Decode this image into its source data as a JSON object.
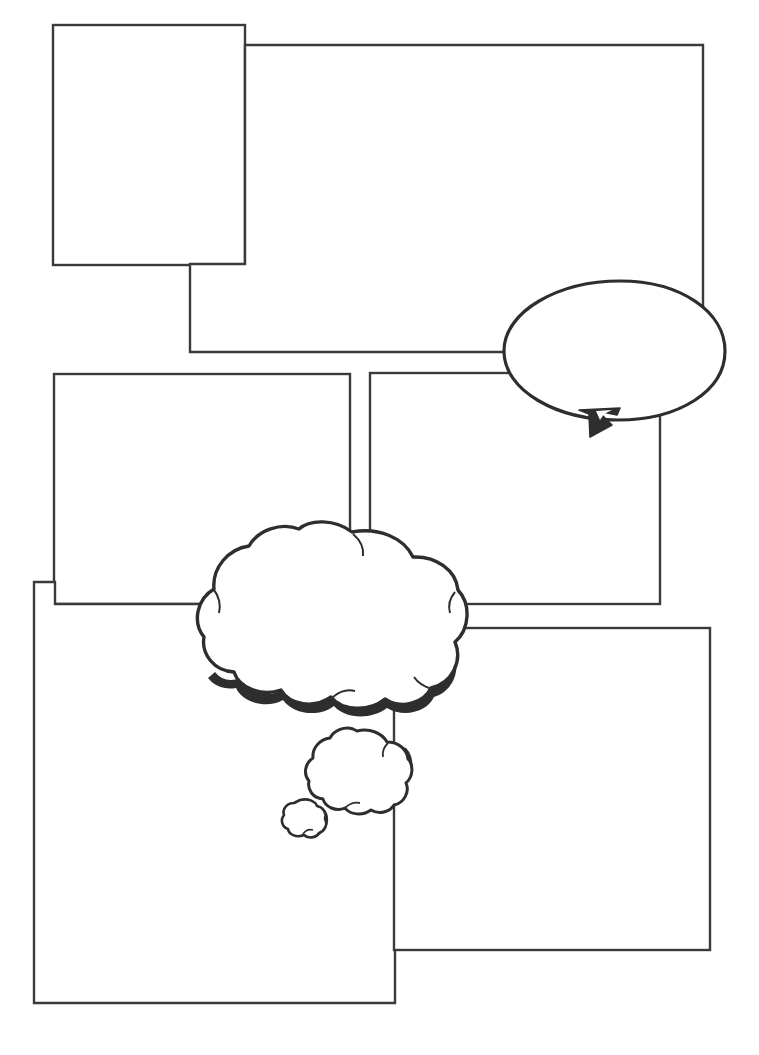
{
  "document": {
    "kind": "comic-strip-template",
    "title": "",
    "page_width": 759,
    "page_height": 1055,
    "background_color": "#ffffff",
    "ink_color": "#3a3a3a"
  },
  "panels": [
    {
      "id": "panel-1",
      "name": "top-left-panel",
      "label": "",
      "shape": "rectangle",
      "x": 53,
      "y": 25,
      "width": 192,
      "height": 240,
      "stroke_color": "#3a3a3a",
      "stroke_width": 2.4,
      "fill_color": "#ffffff"
    },
    {
      "id": "panel-2",
      "name": "top-right-panel",
      "label": "",
      "shape": "notched-rectangle",
      "x": 190,
      "y": 45,
      "width": 513,
      "height": 307,
      "stroke_color": "#3a3a3a",
      "stroke_width": 2.4,
      "fill_color": "#ffffff"
    },
    {
      "id": "panel-3",
      "name": "middle-left-panel",
      "label": "",
      "shape": "rectangle",
      "x": 54,
      "y": 374,
      "width": 296,
      "height": 230,
      "stroke_color": "#3a3a3a",
      "stroke_width": 2.4,
      "fill_color": "#ffffff"
    },
    {
      "id": "panel-4",
      "name": "middle-right-panel",
      "label": "",
      "shape": "rectangle",
      "x": 370,
      "y": 373,
      "width": 290,
      "height": 231,
      "stroke_color": "#3a3a3a",
      "stroke_width": 2.4,
      "fill_color": "#ffffff"
    },
    {
      "id": "panel-5",
      "name": "bottom-left-panel",
      "label": "",
      "shape": "notched-rectangle",
      "x": 34,
      "y": 582,
      "width": 361,
      "height": 421,
      "stroke_color": "#3a3a3a",
      "stroke_width": 2.4,
      "fill_color": "#ffffff"
    },
    {
      "id": "panel-6",
      "name": "bottom-right-panel",
      "label": "",
      "shape": "rectangle",
      "x": 394,
      "y": 628,
      "width": 316,
      "height": 322,
      "stroke_color": "#3a3a3a",
      "stroke_width": 2.4,
      "fill_color": "#ffffff"
    }
  ],
  "balloons": [
    {
      "id": "balloon-1",
      "name": "speech-balloon",
      "type": "speech",
      "text": "",
      "center_x": 614,
      "center_y": 350,
      "radius_x": 111,
      "radius_y": 70,
      "tail_direction": "down-left",
      "stroke_color": "#2e2e2e",
      "fill_color": "#ffffff"
    },
    {
      "id": "balloon-2",
      "name": "thought-cloud-large",
      "type": "thought",
      "text": "",
      "center_x": 332,
      "center_y": 622,
      "radius_x": 130,
      "radius_y": 93,
      "stroke_color": "#2e2e2e",
      "fill_color": "#ffffff"
    },
    {
      "id": "balloon-3",
      "name": "thought-cloud-medium",
      "type": "thought",
      "text": "",
      "center_x": 361,
      "center_y": 769,
      "radius_x": 49,
      "radius_y": 39,
      "stroke_color": "#2e2e2e",
      "fill_color": "#ffffff"
    },
    {
      "id": "balloon-4",
      "name": "thought-cloud-small",
      "type": "thought",
      "text": "",
      "center_x": 305,
      "center_y": 819,
      "radius_x": 22,
      "radius_y": 19,
      "stroke_color": "#2e2e2e",
      "fill_color": "#ffffff"
    }
  ]
}
